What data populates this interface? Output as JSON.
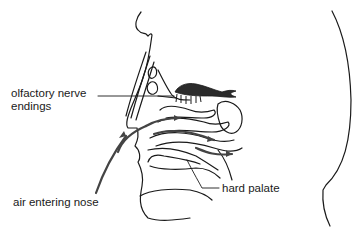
{
  "diagram": {
    "labels": {
      "olfactory_line1": "olfactory nerve",
      "olfactory_line2": "endings",
      "hard_palate": "hard palate",
      "air_entering": "air entering nose"
    },
    "colors": {
      "line": "#1a1a1a",
      "olfactory_bulb": "#2b2b2b",
      "arrows": "#444444",
      "background": "#ffffff"
    }
  }
}
